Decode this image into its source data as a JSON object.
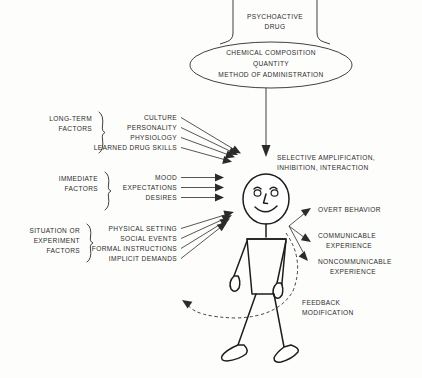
{
  "diagram": {
    "top_box": {
      "label_line1": "PSYCHOACTIVE",
      "label_line2": "DRUG"
    },
    "ellipse": {
      "line1": "CHEMICAL COMPOSITION",
      "line2": "QUANTITY",
      "line3": "METHOD OF ADMINISTRATION"
    },
    "process": {
      "line1": "SELECTIVE AMPLIFICATION,",
      "line2": "INHIBITION, INTERACTION"
    },
    "groups": [
      {
        "name": "long-term-factors",
        "label_line1": "LONG-TERM",
        "label_line2": "FACTORS",
        "label_line3": "",
        "items": [
          "CULTURE",
          "PERSONALITY",
          "PHYSIOLOGY",
          "LEARNED DRUG SKILLS"
        ]
      },
      {
        "name": "immediate-factors",
        "label_line1": "IMMEDIATE",
        "label_line2": "FACTORS",
        "label_line3": "",
        "items": [
          "MOOD",
          "EXPECTATIONS",
          "DESIRES"
        ]
      },
      {
        "name": "situation-or-experiment-factors",
        "label_line1": "SITUATION OR",
        "label_line2": "EXPERIMENT",
        "label_line3": "FACTORS",
        "items": [
          "PHYSICAL SETTING",
          "SOCIAL EVENTS",
          "FORMAL INSTRUCTIONS",
          "IMPLICIT DEMANDS"
        ]
      }
    ],
    "outputs": [
      {
        "name": "overt-behavior",
        "line1": "OVERT BEHAVIOR",
        "line2": ""
      },
      {
        "name": "communicable-experience",
        "line1": "COMMUNICABLE",
        "line2": "EXPERIENCE"
      },
      {
        "name": "noncommunicable-experience",
        "line1": "NONCOMMUNICABLE",
        "line2": "EXPERIENCE"
      }
    ],
    "feedback": {
      "line1": "FEEDBACK",
      "line2": "MODIFICATION"
    },
    "colors": {
      "ink": "#2b2b2b",
      "figure_ink": "#1d1d1d",
      "background": "#fdfdfc"
    }
  }
}
